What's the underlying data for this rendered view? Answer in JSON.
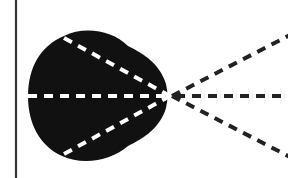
{
  "diagram": {
    "colors": {
      "background": "#ffffff",
      "lobe": "#111111",
      "inner_rays": "#ffffff",
      "outer_rays": "#222222",
      "wall_line": "#333333"
    },
    "wall": {
      "x": 16,
      "y1": 0,
      "y2": 178
    },
    "focal_point": {
      "x": 170,
      "y": 96
    },
    "inner_rays": [
      {
        "name": "upper",
        "x1": 64,
        "y1": 40
      },
      {
        "name": "middle",
        "x1": 28,
        "y1": 96
      },
      {
        "name": "lower",
        "x1": 64,
        "y1": 152
      }
    ],
    "outer_rays": [
      {
        "name": "upper",
        "x2": 288,
        "y2": 40
      },
      {
        "name": "middle",
        "x2": 288,
        "y2": 96
      },
      {
        "name": "lower",
        "x2": 288,
        "y2": 152
      }
    ]
  }
}
